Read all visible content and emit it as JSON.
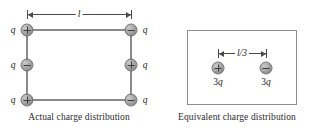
{
  "figure": {
    "background": "#ffffff",
    "charge_fill": "#a8a8a8",
    "wire_color": "#8a8a8a",
    "line_color": "#4a4a4a"
  },
  "left_panel": {
    "caption": "Actual charge distribution",
    "dimension": {
      "label": "l",
      "orientation": "horizontal"
    },
    "charges": [
      {
        "position": "top-left",
        "sign": "+",
        "label": "q",
        "label_side": "left"
      },
      {
        "position": "top-right",
        "sign": "−",
        "label": "q",
        "label_side": "right"
      },
      {
        "position": "middle-left",
        "sign": "−",
        "label": "q",
        "label_side": "left"
      },
      {
        "position": "middle-right",
        "sign": "+",
        "label": "q",
        "label_side": "right"
      },
      {
        "position": "bottom-left",
        "sign": "+",
        "label": "q",
        "label_side": "left"
      },
      {
        "position": "bottom-right",
        "sign": "−",
        "label": "q",
        "label_side": "right"
      }
    ]
  },
  "right_panel": {
    "caption": "Equivalent charge distribution",
    "dimension": {
      "label": "l/3",
      "orientation": "horizontal"
    },
    "charges": [
      {
        "position": "left",
        "sign": "+",
        "label_prefix": "3",
        "label_symbol": "q"
      },
      {
        "position": "right",
        "sign": "−",
        "label_prefix": "3",
        "label_symbol": "q"
      }
    ]
  }
}
